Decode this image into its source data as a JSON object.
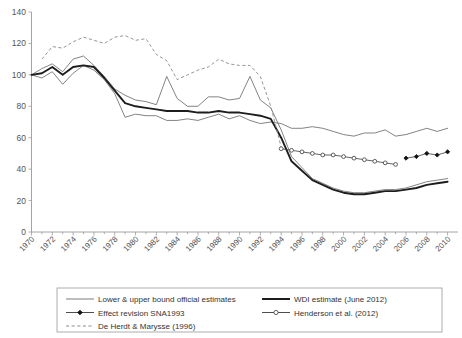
{
  "chart_data": {
    "type": "line",
    "title": "",
    "xlabel": "",
    "ylabel": "",
    "xlim": [
      1970,
      2011
    ],
    "ylim": [
      0,
      140
    ],
    "ytick_values": [
      0,
      20,
      40,
      60,
      80,
      100,
      120,
      140
    ],
    "ytick_labels": [
      "0",
      "20",
      "40",
      "60",
      "80",
      "100",
      "120",
      "140"
    ],
    "xtick_values": [
      1970,
      1972,
      1974,
      1976,
      1978,
      1980,
      1982,
      1984,
      1986,
      1988,
      1990,
      1992,
      1994,
      1996,
      1998,
      2000,
      2002,
      2004,
      2006,
      2008,
      2010
    ],
    "xtick_labels": [
      "1970",
      "1972",
      "1974",
      "1976",
      "1978",
      "1980",
      "1982",
      "1984",
      "1986",
      "1988",
      "1990",
      "1992",
      "1994",
      "1996",
      "1998",
      "2000",
      "2002",
      "2004",
      "2006",
      "2008",
      "2010"
    ],
    "xtick_minor_step": 1,
    "grid": false,
    "legend_position": "below-plot",
    "series": [
      {
        "name": "Lower bound official estimate",
        "style": "thin-solid",
        "x": [
          1970,
          1971,
          1972,
          1973,
          1974,
          1975,
          1976,
          1977,
          1978,
          1979,
          1980,
          1981,
          1982,
          1983,
          1984,
          1985,
          1986,
          1987,
          1988,
          1989,
          1990,
          1991,
          1992,
          1993,
          1994,
          1995,
          1996,
          1997,
          1998,
          1999,
          2000,
          2001,
          2002,
          2003,
          2004,
          2005,
          2006,
          2007,
          2008,
          2009,
          2010
        ],
        "values": [
          100,
          98,
          102,
          94,
          101,
          106,
          103,
          97,
          88,
          73,
          75,
          74,
          74,
          71,
          71,
          72,
          71,
          73,
          75,
          72,
          74,
          71,
          69,
          70,
          69,
          66,
          66,
          67,
          66,
          64,
          62,
          61,
          63,
          63,
          65,
          61,
          62,
          64,
          66,
          64,
          66
        ],
        "note": "thin line forming the lower edge of the official-estimate band"
      },
      {
        "name": "Upper bound official estimate",
        "style": "thin-solid",
        "x": [
          1970,
          1971,
          1972,
          1973,
          1974,
          1975,
          1976,
          1977,
          1978,
          1979,
          1980,
          1981,
          1982,
          1983,
          1984,
          1985,
          1986,
          1987,
          1988,
          1989,
          1990,
          1991,
          1992,
          1993,
          1994,
          1995,
          1996,
          1997,
          1998,
          1999,
          2000,
          2001,
          2002,
          2003,
          2004,
          2005,
          2006,
          2007,
          2008,
          2009,
          2010
        ],
        "values": [
          100,
          104,
          107,
          102,
          110,
          112,
          106,
          99,
          91,
          87,
          84,
          83,
          81,
          99,
          85,
          80,
          80,
          86,
          86,
          84,
          85,
          99,
          84,
          79,
          65,
          48,
          41,
          34,
          31,
          28,
          26,
          25,
          25,
          26,
          27,
          27,
          28,
          30,
          32,
          33,
          34
        ],
        "note": "thin line forming the upper edge of the band; spikes near 1983 and 1991"
      },
      {
        "name": "WDI estimate (June 2012)",
        "style": "thick-solid",
        "x": [
          1970,
          1971,
          1972,
          1973,
          1974,
          1975,
          1976,
          1977,
          1978,
          1979,
          1980,
          1981,
          1982,
          1983,
          1984,
          1985,
          1986,
          1987,
          1988,
          1989,
          1990,
          1991,
          1992,
          1993,
          1994,
          1995,
          1996,
          1997,
          1998,
          1999,
          2000,
          2001,
          2002,
          2003,
          2004,
          2005,
          2006,
          2007,
          2008,
          2009,
          2010
        ],
        "values": [
          100,
          101,
          105,
          100,
          105,
          106,
          105,
          98,
          90,
          82,
          80,
          79,
          78,
          77,
          77,
          77,
          76,
          76,
          77,
          76,
          76,
          75,
          74,
          72,
          60,
          45,
          39,
          33,
          30,
          27,
          25,
          24,
          24,
          25,
          26,
          26,
          27,
          28,
          30,
          31,
          32
        ],
        "note": "heavy black line running through the middle of the band"
      },
      {
        "name": "De Herdt & Marysse (1996)",
        "style": "dashed",
        "x": [
          1971,
          1972,
          1973,
          1974,
          1975,
          1976,
          1977,
          1978,
          1979,
          1980,
          1981,
          1982,
          1983,
          1984,
          1985,
          1986,
          1987,
          1988,
          1989,
          1990,
          1991,
          1992,
          1993,
          1994
        ],
        "values": [
          110,
          118,
          117,
          121,
          124,
          122,
          120,
          124,
          125,
          122,
          123,
          113,
          109,
          97,
          100,
          103,
          105,
          110,
          107,
          106,
          106,
          99,
          80,
          54
        ],
        "note": "dashed grey line, highest series, falls steeply after 1991"
      },
      {
        "name": "Henderson et al. (2012)",
        "style": "open-circle-markers",
        "x": [
          1994,
          1995,
          1996,
          1997,
          1998,
          1999,
          2000,
          2001,
          2002,
          2003,
          2004,
          2005
        ],
        "values": [
          53,
          52,
          51,
          50,
          49,
          49,
          48,
          47,
          46,
          45,
          44,
          43
        ],
        "note": "line with small open circle markers"
      },
      {
        "name": "Effect revision SNA1993",
        "style": "filled-diamond-markers",
        "x": [
          2006,
          2007,
          2008,
          2009,
          2010
        ],
        "values": [
          47,
          48,
          50,
          49,
          51
        ],
        "note": "line with small filled diamond markers at the right edge"
      }
    ],
    "legend": [
      {
        "label": "Lower & upper bound official estimates",
        "style": "thin-solid",
        "column": 0,
        "row": 0
      },
      {
        "label": "WDI estimate (June 2012)",
        "style": "thick-solid",
        "column": 1,
        "row": 0
      },
      {
        "label": "Effect revision SNA1993",
        "style": "filled-diamond-markers",
        "column": 0,
        "row": 1
      },
      {
        "label": "Henderson et al. (2012)",
        "style": "open-circle-markers",
        "column": 1,
        "row": 1
      },
      {
        "label": "De Herdt & Marysse (1996)",
        "style": "dashed",
        "column": 0,
        "row": 2
      }
    ]
  },
  "colors": {
    "background": "#ffffff",
    "axis": "#9a9a9a",
    "thin_series": "#6d6d6d",
    "thick_series": "#1d1d1d",
    "dashed_series": "#8f8f8f",
    "marker_series": "#3a3a3a",
    "tick_label": "#555555",
    "legend_text": "#333333"
  }
}
